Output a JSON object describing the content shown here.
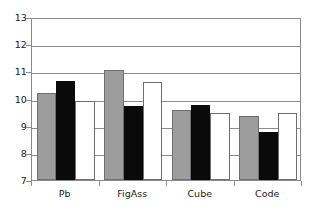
{
  "chart_data": {
    "type": "bar",
    "title": "",
    "subtitle": "",
    "xlabel": "",
    "ylabel": "",
    "categories": [
      "Pb",
      "FigAss",
      "Cube",
      "Code"
    ],
    "series": [
      {
        "name": "series-1",
        "color": "#9d9d9d",
        "values": [
          10.22,
          11.04,
          9.56,
          9.37
        ]
      },
      {
        "name": "series-2",
        "color": "#0a0a0a",
        "values": [
          10.63,
          9.72,
          9.77,
          8.78
        ]
      },
      {
        "name": "series-3",
        "color": "#ffffff",
        "values": [
          9.91,
          10.61,
          9.45,
          9.48
        ]
      }
    ],
    "ylim": [
      7,
      13
    ],
    "yticks": [
      7,
      8,
      9,
      10,
      11,
      12,
      13
    ],
    "ytick_labels": [
      "7",
      "8",
      "9",
      "10",
      "11",
      "12",
      "13"
    ],
    "grid": true,
    "grid_axis": "y",
    "legend": false,
    "legend_position": "none",
    "axis_color": "#8a8a8a",
    "grid_color": "#8d8d8d",
    "text_color": "#1a1a1a",
    "background": "#ffffff"
  }
}
